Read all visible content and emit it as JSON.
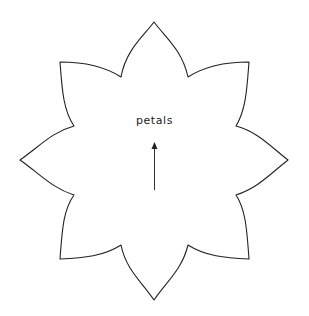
{
  "diagram": {
    "label": "petals",
    "colors": {
      "outline": "#222222",
      "fill": "#ffffff",
      "arrow": "#333333",
      "text": "#222222"
    },
    "shape": "eight-petal flower outline",
    "petal_count": 8
  }
}
